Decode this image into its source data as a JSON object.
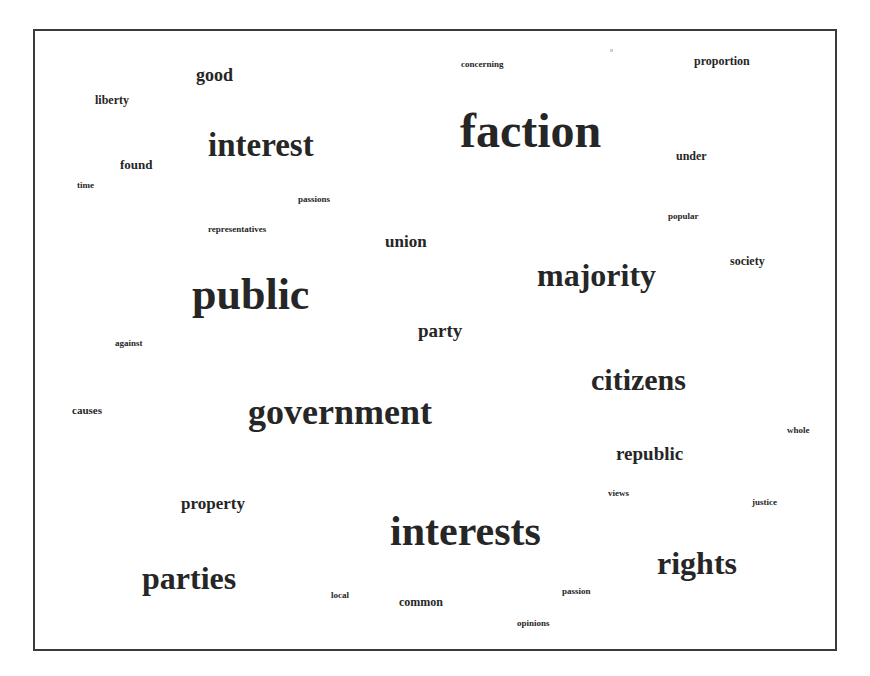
{
  "chart_data": {
    "type": "wordcloud",
    "title": "",
    "layout": {
      "frame": {
        "x": 33,
        "y": 29,
        "width": 804,
        "height": 622,
        "border_color": "#3a3a3a"
      },
      "text_color": "#262626",
      "background": "#ffffff"
    },
    "words": [
      {
        "text": "faction",
        "size": 48,
        "x": 460,
        "y": 145
      },
      {
        "text": "public",
        "size": 44,
        "x": 192,
        "y": 308
      },
      {
        "text": "interests",
        "size": 42,
        "x": 390,
        "y": 544
      },
      {
        "text": "government",
        "size": 36,
        "x": 248,
        "y": 423
      },
      {
        "text": "interest",
        "size": 33,
        "x": 208,
        "y": 155
      },
      {
        "text": "majority",
        "size": 32,
        "x": 537,
        "y": 285
      },
      {
        "text": "rights",
        "size": 32,
        "x": 657,
        "y": 573
      },
      {
        "text": "parties",
        "size": 32,
        "x": 142,
        "y": 588
      },
      {
        "text": "citizens",
        "size": 30,
        "x": 591,
        "y": 389
      },
      {
        "text": "party",
        "size": 19,
        "x": 418,
        "y": 336
      },
      {
        "text": "republic",
        "size": 19,
        "x": 616,
        "y": 459
      },
      {
        "text": "good",
        "size": 18,
        "x": 196,
        "y": 80
      },
      {
        "text": "union",
        "size": 17,
        "x": 385,
        "y": 247
      },
      {
        "text": "property",
        "size": 17,
        "x": 181,
        "y": 509
      },
      {
        "text": "proportion",
        "size": 12,
        "x": 694,
        "y": 65
      },
      {
        "text": "under",
        "size": 12,
        "x": 676,
        "y": 160
      },
      {
        "text": "society",
        "size": 12,
        "x": 730,
        "y": 265
      },
      {
        "text": "liberty",
        "size": 12,
        "x": 95,
        "y": 104
      },
      {
        "text": "found",
        "size": 13,
        "x": 120,
        "y": 168
      },
      {
        "text": "common",
        "size": 12,
        "x": 399,
        "y": 606
      },
      {
        "text": "causes",
        "size": 11,
        "x": 72,
        "y": 414
      },
      {
        "text": "concerning",
        "size": 9,
        "x": 461,
        "y": 67
      },
      {
        "text": "popular",
        "size": 9,
        "x": 668,
        "y": 219
      },
      {
        "text": "time",
        "size": 9,
        "x": 77,
        "y": 188
      },
      {
        "text": "passions",
        "size": 9,
        "x": 298,
        "y": 202
      },
      {
        "text": "representatives",
        "size": 9,
        "x": 208,
        "y": 232
      },
      {
        "text": "against",
        "size": 9,
        "x": 115,
        "y": 346
      },
      {
        "text": "whole",
        "size": 9,
        "x": 787,
        "y": 433
      },
      {
        "text": "views",
        "size": 9,
        "x": 608,
        "y": 496
      },
      {
        "text": "justice",
        "size": 9,
        "x": 752,
        "y": 505
      },
      {
        "text": "local",
        "size": 9,
        "x": 331,
        "y": 598
      },
      {
        "text": "passion",
        "size": 9,
        "x": 562,
        "y": 594
      },
      {
        "text": "opinions",
        "size": 9,
        "x": 517,
        "y": 626
      }
    ]
  }
}
